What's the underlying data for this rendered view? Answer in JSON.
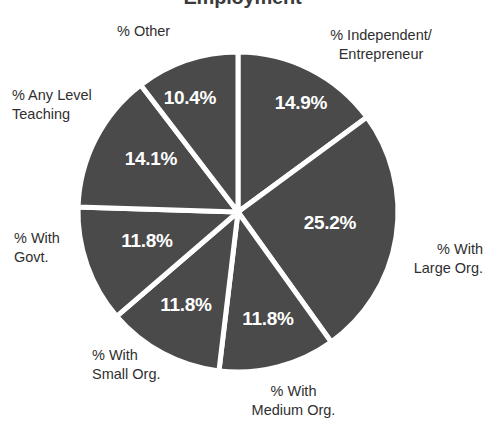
{
  "chart_data": {
    "type": "pie",
    "title": "Employment",
    "categories": [
      "% Independent/\nEntrepreneur",
      "% With\nLarge Org.",
      "% With\nMedium Org.",
      "% With\nSmall Org.",
      "% With\nGovt.",
      "% Any Level\nTeaching",
      "% Other"
    ],
    "values": [
      14.9,
      25.2,
      11.8,
      11.8,
      11.8,
      14.1,
      10.4
    ],
    "value_labels": [
      "14.9%",
      "25.2%",
      "11.8%",
      "11.8%",
      "11.8%",
      "14.1%",
      "10.4%"
    ],
    "xlabel": "",
    "ylabel": "",
    "legend": "none",
    "grid": false,
    "start_angle_deg": 0,
    "direction": "clockwise",
    "colors": {
      "slice_fill": "#4a4a4a",
      "slice_border": "#ffffff",
      "value_text": "#ffffff",
      "category_text": "#2f2f2f",
      "background": "#ffffff"
    },
    "geometry": {
      "center_x": 238,
      "center_y": 212,
      "radius": 160
    },
    "slices": [
      {
        "name": "% Independent/\nEntrepreneur",
        "value": 14.9,
        "value_label": "14.9%",
        "label_x": 301,
        "label_y": 104,
        "cat_x": 296,
        "cat_y": 26,
        "cat_width": 170,
        "cat_align": "align-center"
      },
      {
        "name": "% With\nLarge Org.",
        "value": 25.2,
        "value_label": "25.2%",
        "label_x": 330,
        "label_y": 224,
        "cat_x": 398,
        "cat_y": 240,
        "cat_width": 85,
        "cat_align": "align-right"
      },
      {
        "name": "% With\nMedium Org.",
        "value": 11.8,
        "value_label": "11.8%",
        "label_x": 268,
        "label_y": 320,
        "cat_x": 226,
        "cat_y": 382,
        "cat_width": 135,
        "cat_align": "align-center"
      },
      {
        "name": "% With\nSmall Org.",
        "value": 11.8,
        "value_label": "11.8%",
        "label_x": 186,
        "label_y": 306,
        "cat_x": 92,
        "cat_y": 346,
        "cat_width": 115,
        "cat_align": "align-left"
      },
      {
        "name": "% With\nGovt.",
        "value": 11.8,
        "value_label": "11.8%",
        "label_x": 147,
        "label_y": 242,
        "cat_x": 14,
        "cat_y": 229,
        "cat_width": 105,
        "cat_align": "align-left"
      },
      {
        "name": "% Any Level\nTeaching",
        "value": 14.1,
        "value_label": "14.1%",
        "label_x": 151,
        "label_y": 160,
        "cat_x": 12,
        "cat_y": 86,
        "cat_width": 115,
        "cat_align": "align-left"
      },
      {
        "name": "% Other",
        "value": 10.4,
        "value_label": "10.4%",
        "label_x": 190,
        "label_y": 99,
        "cat_x": 117,
        "cat_y": 22,
        "cat_width": 100,
        "cat_align": "align-left"
      }
    ]
  }
}
